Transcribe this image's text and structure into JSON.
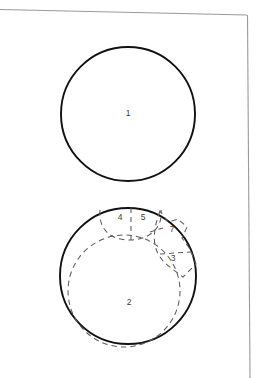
{
  "figure": {
    "title": "",
    "background_color": "#ffffff",
    "page_border_color": "#9a9a9a",
    "solid_stroke_color": "#111111",
    "dashed_stroke_color": "#5c5c5c",
    "label_color": "#3a3a3a",
    "labels": [
      {
        "id": "1",
        "text": "1",
        "x": 128,
        "y": 114
      },
      {
        "id": "2",
        "text": "2",
        "x": 129,
        "y": 303
      },
      {
        "id": "3",
        "text": "3",
        "x": 173,
        "y": 259
      },
      {
        "id": "4",
        "text": "4",
        "x": 120,
        "y": 218
      },
      {
        "id": "5",
        "text": "5",
        "x": 143,
        "y": 218
      },
      {
        "id": "7",
        "text": "7",
        "x": 172,
        "y": 230
      }
    ],
    "shapes": {
      "upper_circle": {
        "cx": 128,
        "cy": 114,
        "r": 67
      },
      "lower_circle": {
        "cx": 128,
        "cy": 276,
        "r": 68
      },
      "inner_dashed_circle": {
        "cx": 124,
        "cy": 291,
        "r": 56
      }
    }
  }
}
